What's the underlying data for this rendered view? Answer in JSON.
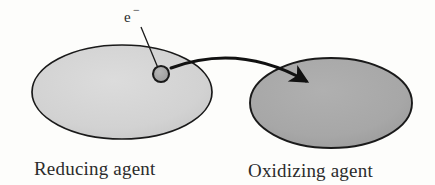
{
  "figure": {
    "background_color": "#fdfdfb"
  },
  "reducing_agent": {
    "label": "Reducing agent",
    "fill_color": "#d3d3d3",
    "stroke_color": "#1a1a1a",
    "shape": "ellipse",
    "cx": 122,
    "cy": 92,
    "rx": 90,
    "ry": 47
  },
  "oxidizing_agent": {
    "label": "Oxidizing agent",
    "fill_color": "#a8a8a8",
    "stroke_color": "#1a1a1a",
    "shape": "ellipse",
    "cx": 331,
    "cy": 103,
    "rx": 81,
    "ry": 45
  },
  "electron": {
    "label": "e",
    "charge_symbol": "−",
    "fill_color": "#a0a0a0",
    "stroke_color": "#1a1a1a",
    "cx": 161,
    "cy": 74,
    "r": 8,
    "leader_line": {
      "from_x": 141,
      "from_y": 27,
      "to_x": 158,
      "to_y": 68
    },
    "label_x": 124,
    "label_y": 22
  },
  "transfer_arrow": {
    "name": "electron-transfer-arrow",
    "stroke_color": "#111111",
    "stroke_width": 3,
    "start_x": 171,
    "start_y": 68,
    "control_x": 240,
    "control_y": 43,
    "end_x": 306,
    "end_y": 81
  },
  "captions": {
    "left_x": 34,
    "left_y": 175,
    "right_x": 248,
    "right_y": 177
  }
}
